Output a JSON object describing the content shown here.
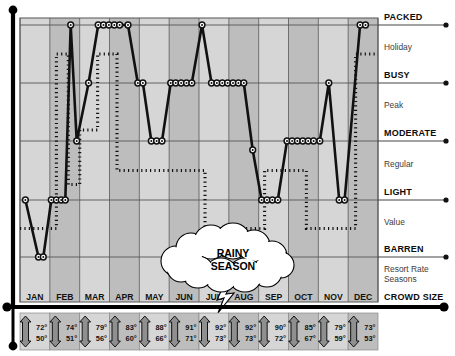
{
  "chart_data": {
    "type": "line",
    "xlabel": "CROWD SIZE",
    "categories": [
      "JAN",
      "FEB",
      "MAR",
      "APR",
      "MAY",
      "JUN",
      "JUL",
      "AUG",
      "SEP",
      "OCT",
      "NOV",
      "DEC"
    ],
    "crowd_levels": [
      "PACKED",
      "BUSY",
      "MODERATE",
      "LIGHT",
      "BARREN"
    ],
    "rate_levels": [
      "Holiday",
      "Peak",
      "Regular",
      "Value"
    ],
    "grid": true,
    "legend": "none",
    "series": [
      {
        "name": "Crowd Size",
        "style": "solid-with-markers",
        "points": [
          {
            "x": 0.18,
            "level": "LIGHT"
          },
          {
            "x": 0.62,
            "level": "BARREN"
          },
          {
            "x": 0.78,
            "level": "BARREN"
          },
          {
            "x": 1.05,
            "level": "LIGHT"
          },
          {
            "x": 1.22,
            "level": "LIGHT"
          },
          {
            "x": 1.38,
            "level": "LIGHT"
          },
          {
            "x": 1.52,
            "level": "LIGHT"
          },
          {
            "x": 1.7,
            "level": "PACKED"
          },
          {
            "x": 1.9,
            "level": "MODERATE"
          },
          {
            "x": 2.3,
            "level": "BUSY"
          },
          {
            "x": 2.62,
            "level": "PACKED"
          },
          {
            "x": 2.8,
            "level": "PACKED"
          },
          {
            "x": 2.98,
            "level": "PACKED"
          },
          {
            "x": 3.16,
            "level": "PACKED"
          },
          {
            "x": 3.34,
            "level": "PACKED"
          },
          {
            "x": 3.62,
            "level": "PACKED"
          },
          {
            "x": 3.95,
            "level": "BUSY"
          },
          {
            "x": 4.12,
            "level": "BUSY"
          },
          {
            "x": 4.4,
            "level": "MODERATE"
          },
          {
            "x": 4.58,
            "level": "MODERATE"
          },
          {
            "x": 4.76,
            "level": "MODERATE"
          },
          {
            "x": 5.05,
            "level": "BUSY"
          },
          {
            "x": 5.22,
            "level": "BUSY"
          },
          {
            "x": 5.4,
            "level": "BUSY"
          },
          {
            "x": 5.58,
            "level": "BUSY"
          },
          {
            "x": 5.76,
            "level": "BUSY"
          },
          {
            "x": 6.1,
            "level": "PACKED"
          },
          {
            "x": 6.42,
            "level": "BUSY"
          },
          {
            "x": 6.6,
            "level": "BUSY"
          },
          {
            "x": 6.78,
            "level": "BUSY"
          },
          {
            "x": 6.96,
            "level": "BUSY"
          },
          {
            "x": 7.14,
            "level": "BUSY"
          },
          {
            "x": 7.32,
            "level": "BUSY"
          },
          {
            "x": 7.5,
            "level": "BUSY"
          },
          {
            "x": 7.8,
            "level": "MODERATE-LOW"
          },
          {
            "x": 8.1,
            "level": "LIGHT"
          },
          {
            "x": 8.28,
            "level": "LIGHT"
          },
          {
            "x": 8.46,
            "level": "LIGHT"
          },
          {
            "x": 8.64,
            "level": "LIGHT"
          },
          {
            "x": 8.95,
            "level": "MODERATE"
          },
          {
            "x": 9.12,
            "level": "MODERATE"
          },
          {
            "x": 9.3,
            "level": "MODERATE"
          },
          {
            "x": 9.48,
            "level": "MODERATE"
          },
          {
            "x": 9.66,
            "level": "MODERATE"
          },
          {
            "x": 9.84,
            "level": "MODERATE"
          },
          {
            "x": 10.05,
            "level": "MODERATE"
          },
          {
            "x": 10.35,
            "level": "BUSY"
          },
          {
            "x": 10.7,
            "level": "LIGHT"
          },
          {
            "x": 10.88,
            "level": "LIGHT"
          },
          {
            "x": 11.4,
            "level": "PACKED"
          },
          {
            "x": 11.58,
            "level": "PACKED"
          }
        ]
      },
      {
        "name": "Resort Rate Seasons",
        "style": "dotted-step",
        "steps": [
          {
            "from": 0.0,
            "to": 1.22,
            "level": "Value"
          },
          {
            "from": 1.22,
            "to": 1.62,
            "level": "Holiday"
          },
          {
            "from": 1.62,
            "to": 2.0,
            "level": "Regular-low"
          },
          {
            "from": 2.0,
            "to": 2.6,
            "level": "Peak-low"
          },
          {
            "from": 2.6,
            "to": 3.25,
            "level": "Holiday"
          },
          {
            "from": 3.25,
            "to": 4.05,
            "level": "Regular"
          },
          {
            "from": 4.05,
            "to": 6.2,
            "level": "Regular"
          },
          {
            "from": 6.2,
            "to": 8.2,
            "level": "Value"
          },
          {
            "from": 8.2,
            "to": 9.6,
            "level": "Regular"
          },
          {
            "from": 9.6,
            "to": 11.25,
            "level": "Value"
          },
          {
            "from": 11.25,
            "to": 12.0,
            "level": "Holiday"
          }
        ]
      }
    ]
  },
  "axis": {
    "crowd_labels": [
      {
        "text": "PACKED",
        "kind": "bold"
      },
      {
        "text": "Holiday",
        "kind": "regular"
      },
      {
        "text": "BUSY",
        "kind": "bold"
      },
      {
        "text": "Peak",
        "kind": "regular"
      },
      {
        "text": "MODERATE",
        "kind": "bold"
      },
      {
        "text": "Regular",
        "kind": "regular"
      },
      {
        "text": "LIGHT",
        "kind": "bold"
      },
      {
        "text": "Value",
        "kind": "regular"
      },
      {
        "text": "BARREN",
        "kind": "bold"
      }
    ],
    "legend_rate": "Resort Rate",
    "legend_rate2": "Seasons",
    "legend_crowd": "CROWD SIZE"
  },
  "annotation": {
    "cloud_line1": "RAINY",
    "cloud_line2": "SEASON"
  },
  "temperatures": {
    "months": [
      {
        "month": "JAN",
        "high": "72°",
        "low": "50°"
      },
      {
        "month": "FEB",
        "high": "74°",
        "low": "51°"
      },
      {
        "month": "MAR",
        "high": "79°",
        "low": "56°"
      },
      {
        "month": "APR",
        "high": "83°",
        "low": "60°"
      },
      {
        "month": "MAY",
        "high": "88°",
        "low": "66°"
      },
      {
        "month": "JUN",
        "high": "91°",
        "low": "71°"
      },
      {
        "month": "JUL",
        "high": "92°",
        "low": "73°"
      },
      {
        "month": "AUG",
        "high": "92°",
        "low": "73°"
      },
      {
        "month": "SEP",
        "high": "90°",
        "low": "72°"
      },
      {
        "month": "OCT",
        "high": "85°",
        "low": "67°"
      },
      {
        "month": "NOV",
        "high": "79°",
        "low": "59°"
      },
      {
        "month": "DEC",
        "high": "73°",
        "low": "53°"
      }
    ]
  },
  "colors": {
    "shade_light": "#d6d6d6",
    "shade_dark": "#bdbdbd",
    "line": "#111111",
    "grid": "#555555",
    "text": "#111111",
    "subtext": "#3c3c3c"
  }
}
